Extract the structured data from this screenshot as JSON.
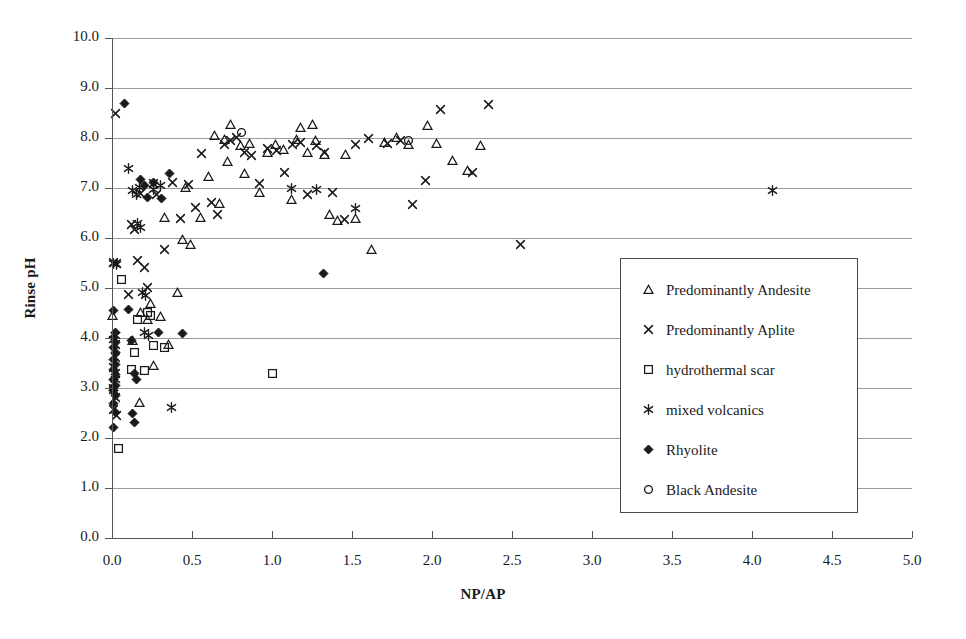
{
  "chart_data": {
    "type": "scatter",
    "title": "",
    "xlabel": "NP/AP",
    "ylabel": "Rinse pH",
    "xlim": [
      0.0,
      5.0
    ],
    "ylim": [
      0.0,
      10.0
    ],
    "xticks": [
      "0.0",
      "0.5",
      "1.0",
      "1.5",
      "2.0",
      "2.5",
      "3.0",
      "3.5",
      "4.0",
      "4.5",
      "5.0"
    ],
    "yticks": [
      "0.0",
      "1.0",
      "2.0",
      "3.0",
      "4.0",
      "5.0",
      "6.0",
      "7.0",
      "8.0",
      "9.0",
      "10.0"
    ],
    "xtick_step": 0.5,
    "ytick_step": 1.0,
    "grid": "horizontal",
    "legend_position": "inside-lower-right",
    "series": [
      {
        "name": "Predominantly Andesite",
        "marker": "triangle-open",
        "color": "#1a1a1a",
        "points": [
          [
            0.0,
            4.45
          ],
          [
            0.13,
            3.95
          ],
          [
            0.17,
            2.72
          ],
          [
            0.18,
            4.52
          ],
          [
            0.22,
            4.38
          ],
          [
            0.24,
            4.7
          ],
          [
            0.26,
            3.45
          ],
          [
            0.3,
            4.43
          ],
          [
            0.33,
            6.42
          ],
          [
            0.35,
            3.88
          ],
          [
            0.41,
            4.92
          ],
          [
            0.44,
            5.98
          ],
          [
            0.46,
            7.02
          ],
          [
            0.49,
            5.88
          ],
          [
            0.55,
            6.42
          ],
          [
            0.6,
            7.24
          ],
          [
            0.64,
            8.05
          ],
          [
            0.67,
            6.7
          ],
          [
            0.7,
            7.97
          ],
          [
            0.72,
            7.54
          ],
          [
            0.74,
            8.28
          ],
          [
            0.8,
            7.85
          ],
          [
            0.83,
            7.3
          ],
          [
            0.86,
            7.9
          ],
          [
            0.92,
            6.92
          ],
          [
            0.97,
            7.72
          ],
          [
            1.02,
            7.88
          ],
          [
            1.07,
            7.78
          ],
          [
            1.12,
            6.78
          ],
          [
            1.15,
            7.98
          ],
          [
            1.18,
            8.22
          ],
          [
            1.22,
            7.72
          ],
          [
            1.25,
            8.28
          ],
          [
            1.27,
            7.95
          ],
          [
            1.33,
            7.68
          ],
          [
            1.36,
            6.48
          ],
          [
            1.41,
            6.35
          ],
          [
            1.46,
            7.68
          ],
          [
            1.52,
            6.4
          ],
          [
            1.62,
            5.78
          ],
          [
            1.7,
            7.92
          ],
          [
            1.78,
            8.02
          ],
          [
            1.85,
            7.88
          ],
          [
            1.97,
            8.25
          ],
          [
            2.03,
            7.9
          ],
          [
            2.13,
            7.55
          ],
          [
            2.22,
            7.36
          ],
          [
            2.3,
            7.85
          ]
        ]
      },
      {
        "name": "Predominantly Aplite",
        "marker": "x-cross",
        "color": "#1a1a1a",
        "points": [
          [
            0.02,
            8.5
          ],
          [
            0.01,
            5.52
          ],
          [
            0.03,
            5.5
          ],
          [
            0.02,
            3.88
          ],
          [
            0.02,
            3.62
          ],
          [
            0.01,
            3.42
          ],
          [
            0.02,
            3.3
          ],
          [
            0.01,
            3.1
          ],
          [
            0.01,
            2.98
          ],
          [
            0.02,
            2.82
          ],
          [
            0.01,
            2.58
          ],
          [
            0.03,
            2.45
          ],
          [
            0.1,
            4.88
          ],
          [
            0.12,
            6.28
          ],
          [
            0.14,
            6.18
          ],
          [
            0.16,
            5.55
          ],
          [
            0.18,
            6.9
          ],
          [
            0.2,
            5.42
          ],
          [
            0.22,
            5.02
          ],
          [
            0.26,
            7.1
          ],
          [
            0.28,
            6.88
          ],
          [
            0.33,
            5.78
          ],
          [
            0.38,
            7.12
          ],
          [
            0.43,
            6.4
          ],
          [
            0.48,
            7.08
          ],
          [
            0.52,
            6.62
          ],
          [
            0.56,
            7.7
          ],
          [
            0.62,
            6.72
          ],
          [
            0.66,
            6.48
          ],
          [
            0.7,
            7.88
          ],
          [
            0.74,
            7.95
          ],
          [
            0.78,
            8.02
          ],
          [
            0.83,
            7.72
          ],
          [
            0.87,
            7.66
          ],
          [
            0.92,
            7.1
          ],
          [
            0.97,
            7.8
          ],
          [
            1.03,
            7.76
          ],
          [
            1.08,
            7.32
          ],
          [
            1.13,
            7.88
          ],
          [
            1.18,
            7.92
          ],
          [
            1.22,
            6.88
          ],
          [
            1.28,
            7.85
          ],
          [
            1.33,
            7.72
          ],
          [
            1.38,
            6.92
          ],
          [
            1.45,
            6.38
          ],
          [
            1.52,
            7.88
          ],
          [
            1.6,
            8.0
          ],
          [
            1.72,
            7.9
          ],
          [
            1.8,
            7.95
          ],
          [
            1.88,
            6.68
          ],
          [
            1.96,
            7.15
          ],
          [
            2.05,
            8.58
          ],
          [
            2.25,
            7.32
          ],
          [
            2.35,
            8.68
          ],
          [
            2.55,
            5.88
          ]
        ]
      },
      {
        "name": "hydrothermal scar",
        "marker": "square-open",
        "color": "#1a1a1a",
        "points": [
          [
            0.04,
            1.8
          ],
          [
            0.06,
            5.18
          ],
          [
            0.12,
            3.38
          ],
          [
            0.14,
            3.72
          ],
          [
            0.16,
            4.38
          ],
          [
            0.2,
            3.35
          ],
          [
            0.22,
            4.52
          ],
          [
            0.24,
            4.45
          ],
          [
            0.26,
            3.85
          ],
          [
            0.33,
            3.82
          ],
          [
            1.0,
            3.3
          ]
        ]
      },
      {
        "name": "mixed volcanics",
        "marker": "asterisk",
        "color": "#1a1a1a",
        "points": [
          [
            0.01,
            5.5
          ],
          [
            0.03,
            5.48
          ],
          [
            0.02,
            4.05
          ],
          [
            0.01,
            3.98
          ],
          [
            0.02,
            3.18
          ],
          [
            0.01,
            3.02
          ],
          [
            0.1,
            7.4
          ],
          [
            0.13,
            6.95
          ],
          [
            0.15,
            6.88
          ],
          [
            0.17,
            7.02
          ],
          [
            0.16,
            6.3
          ],
          [
            0.18,
            6.22
          ],
          [
            0.19,
            4.92
          ],
          [
            0.21,
            4.86
          ],
          [
            0.2,
            4.12
          ],
          [
            0.23,
            4.05
          ],
          [
            0.26,
            6.98
          ],
          [
            0.3,
            7.05
          ],
          [
            0.37,
            2.62
          ],
          [
            1.12,
            7.0
          ],
          [
            1.28,
            6.98
          ],
          [
            1.52,
            6.6
          ],
          [
            4.13,
            6.95
          ]
        ]
      },
      {
        "name": "Rhyolite",
        "marker": "diamond-filled",
        "color": "#1a1a1a",
        "points": [
          [
            0.08,
            8.7
          ],
          [
            0.01,
            4.55
          ],
          [
            0.02,
            4.12
          ],
          [
            0.01,
            4.02
          ],
          [
            0.02,
            3.92
          ],
          [
            0.01,
            3.82
          ],
          [
            0.02,
            3.72
          ],
          [
            0.01,
            3.58
          ],
          [
            0.02,
            3.48
          ],
          [
            0.01,
            3.38
          ],
          [
            0.02,
            3.28
          ],
          [
            0.01,
            3.18
          ],
          [
            0.02,
            3.05
          ],
          [
            0.01,
            2.95
          ],
          [
            0.02,
            2.85
          ],
          [
            0.01,
            2.7
          ],
          [
            0.02,
            2.52
          ],
          [
            0.01,
            2.22
          ],
          [
            0.1,
            4.58
          ],
          [
            0.12,
            3.95
          ],
          [
            0.14,
            3.3
          ],
          [
            0.15,
            3.18
          ],
          [
            0.13,
            2.5
          ],
          [
            0.14,
            2.32
          ],
          [
            0.18,
            7.18
          ],
          [
            0.2,
            7.05
          ],
          [
            0.22,
            6.82
          ],
          [
            0.26,
            7.12
          ],
          [
            0.31,
            6.8
          ],
          [
            0.36,
            7.3
          ],
          [
            0.29,
            4.12
          ],
          [
            0.44,
            4.1
          ],
          [
            1.32,
            5.3
          ]
        ]
      },
      {
        "name": "Black Andesite",
        "marker": "circle-open",
        "color": "#1a1a1a",
        "points": [
          [
            0.81,
            8.12
          ],
          [
            1.85,
            7.95
          ]
        ]
      }
    ]
  },
  "legend": {
    "entries": [
      {
        "label": "Predominantly Andesite",
        "marker": "triangle-open"
      },
      {
        "label": "Predominantly Aplite",
        "marker": "x-cross"
      },
      {
        "label": "hydrothermal scar",
        "marker": "square-open"
      },
      {
        "label": "mixed volcanics",
        "marker": "asterisk"
      },
      {
        "label": "Rhyolite",
        "marker": "diamond-filled"
      },
      {
        "label": "Black Andesite",
        "marker": "circle-open"
      }
    ]
  },
  "colors": {
    "ink": "#1a1a1a",
    "grid": "#9a9a9a",
    "axis": "#555555",
    "background": "#ffffff"
  }
}
